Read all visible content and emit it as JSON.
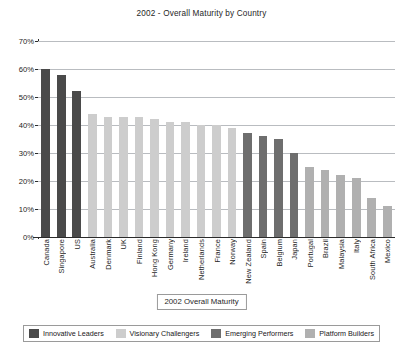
{
  "chart_data": {
    "type": "bar",
    "title": "2002 - Overall Maturity by Country",
    "xlabel": "2002 Overall Maturity",
    "ylabel": "",
    "ylim": [
      0,
      70
    ],
    "grid": true,
    "legend_position": "bottom",
    "ytick_labels": [
      "70%",
      "60%",
      "50%",
      "40%",
      "30%",
      "20%",
      "10%",
      "0%"
    ],
    "ytick_values": [
      70,
      60,
      50,
      40,
      30,
      20,
      10,
      0
    ],
    "categories": [
      "Canada",
      "Singapore",
      "US",
      "Australia",
      "Denmark",
      "UK",
      "Finland",
      "Hong Kong",
      "Germany",
      "Ireland",
      "Netherlands",
      "France",
      "Norway",
      "New Zealand",
      "Spain",
      "Belgium",
      "Japan",
      "Portugal",
      "Brazil",
      "Malaysia",
      "Italy",
      "South Africa",
      "Mexico"
    ],
    "values": [
      60,
      58,
      52,
      44,
      43,
      43,
      43,
      42,
      41,
      41,
      40,
      40,
      39,
      37,
      36,
      35,
      30,
      25,
      24,
      22,
      21,
      14,
      11
    ],
    "groups": [
      "Innovative Leaders",
      "Innovative Leaders",
      "Innovative Leaders",
      "Visionary Challengers",
      "Visionary Challengers",
      "Visionary Challengers",
      "Visionary Challengers",
      "Visionary Challengers",
      "Visionary Challengers",
      "Visionary Challengers",
      "Visionary Challengers",
      "Visionary Challengers",
      "Visionary Challengers",
      "Emerging Performers",
      "Emerging Performers",
      "Emerging Performers",
      "Emerging Performers",
      "Platform Builders",
      "Platform Builders",
      "Platform Builders",
      "Platform Builders",
      "Platform Builders",
      "Platform Builders"
    ],
    "legend": [
      {
        "label": "Innovative Leaders",
        "color": "#4a4a4a"
      },
      {
        "label": "Visionary Challengers",
        "color": "#cdcdcd"
      },
      {
        "label": "Emerging Performers",
        "color": "#6e6e6e"
      },
      {
        "label": "Platform Builders",
        "color": "#b0b0b0"
      }
    ],
    "group_colors": {
      "Innovative Leaders": "#4a4a4a",
      "Visionary Challengers": "#cdcdcd",
      "Emerging Performers": "#6e6e6e",
      "Platform Builders": "#b0b0b0"
    },
    "grid_color": "#b9bcc0",
    "axis_color": "#2b2b2b"
  }
}
